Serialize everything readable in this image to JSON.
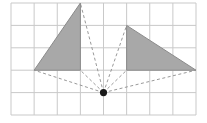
{
  "diagram": {
    "type": "grid-projection",
    "grid": {
      "columns": 8,
      "rows": 5,
      "origin_px": [
        11,
        3
      ],
      "cell_w": 23.125,
      "cell_h": 22.4,
      "line_color": "#c9c9c9"
    },
    "shapes": [
      {
        "name": "left-triangle",
        "vertices": [
          [
            1,
            3
          ],
          [
            3,
            0
          ],
          [
            3,
            3
          ]
        ],
        "fill": "#a8a8a8"
      },
      {
        "name": "right-triangle",
        "vertices": [
          [
            5,
            1
          ],
          [
            5,
            3
          ],
          [
            8,
            3
          ]
        ],
        "fill": "#a8a8a8"
      }
    ],
    "center_point": {
      "name": "projection-center",
      "at": [
        4,
        4
      ],
      "color": "#1a1a1a"
    },
    "rays": [
      [
        1,
        3
      ],
      [
        3,
        0
      ],
      [
        3,
        3
      ],
      [
        5,
        1
      ],
      [
        5,
        3
      ],
      [
        8,
        3
      ]
    ]
  }
}
